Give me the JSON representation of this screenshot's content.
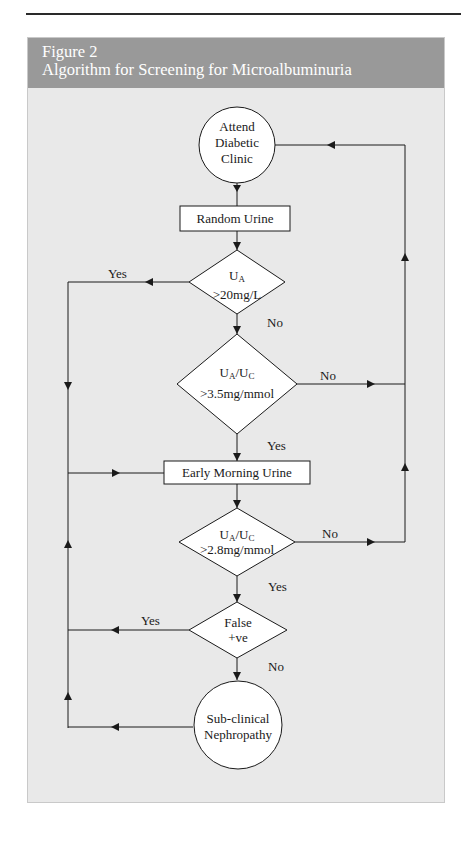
{
  "figure": {
    "number": "Figure 2",
    "title": "Algorithm for Screening for Microalbuminuria"
  },
  "colors": {
    "header_bg": "#999999",
    "panel_bg": "#e9e9e9",
    "node_fill": "#ffffff",
    "line": "#1a1a1a"
  },
  "nodes": {
    "start": {
      "shape": "circle",
      "lines": [
        "Attend",
        "Diabetic",
        "Clinic"
      ]
    },
    "random_urine": {
      "shape": "rect",
      "label": "Random Urine"
    },
    "d1": {
      "shape": "diamond",
      "main": "U",
      "sub": "A",
      "line2": ">20mg/L"
    },
    "d2": {
      "shape": "diamond",
      "a": "U",
      "a_sub": "A",
      "slash": "/U",
      "c_sub": "C",
      "line2": ">3.5mg/mmol"
    },
    "early_urine": {
      "shape": "rect",
      "label": "Early Morning Urine"
    },
    "d3": {
      "shape": "diamond",
      "a": "U",
      "a_sub": "A",
      "slash": "/U",
      "c_sub": "C",
      "line2": ">2.8mg/mmol"
    },
    "d4": {
      "shape": "diamond",
      "lines": [
        "False",
        "+ve"
      ]
    },
    "end": {
      "shape": "circle",
      "lines": [
        "Sub-clinical",
        "Nephropathy"
      ]
    }
  },
  "edges": {
    "d1_yes": "Yes",
    "d1_no": "No",
    "d2_no": "No",
    "d2_yes": "Yes",
    "d3_no": "No",
    "d3_yes": "Yes",
    "d4_yes": "Yes",
    "d4_no": "No"
  }
}
